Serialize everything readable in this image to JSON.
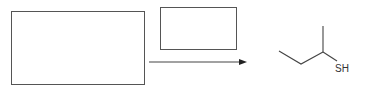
{
  "diagram": {
    "type": "reaction-scheme",
    "reactant_placeholder": {
      "label": ""
    },
    "reagent_placeholder": {
      "label": ""
    },
    "arrow": {
      "direction": "right"
    },
    "product": {
      "name": "2-butanethiol (skeletal)",
      "heteroatom_label": "SH"
    }
  }
}
